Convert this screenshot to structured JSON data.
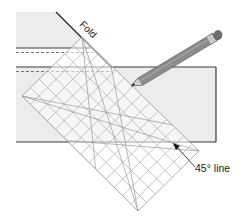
{
  "figure": {
    "kind": "quilting-instruction-illustration",
    "labels": {
      "fold": "Fold",
      "angle_line": "45° line"
    },
    "elements": {
      "fabric": "folded fabric strip",
      "ruler": "gridded acrylic ruler",
      "pencil": "pencil marking along ruler edge"
    },
    "colors": {
      "fabric_fill": "#ececec",
      "fabric_edge": "#3a3a3a",
      "ruler_grid": "#9a9a9a",
      "ruler_fill": "#ffffff",
      "pencil_body": "#8a8a8a",
      "text": "#222222"
    }
  }
}
